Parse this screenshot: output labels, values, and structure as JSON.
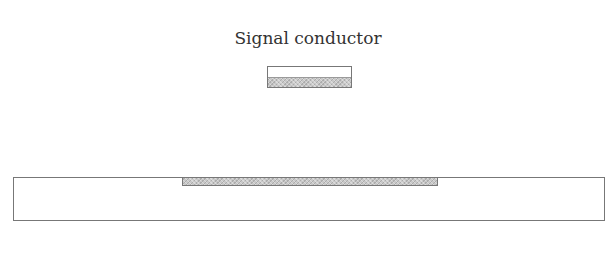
{
  "diagram": {
    "signal_label": "Signal conductor",
    "elements": [
      {
        "name": "signal-conductor",
        "shape": "rectangle",
        "fill": "partial-hatch-bottom"
      },
      {
        "name": "substrate",
        "shape": "rectangle",
        "fill": "none"
      },
      {
        "name": "ground-strip",
        "shape": "rectangle",
        "fill": "hatch"
      }
    ],
    "colors": {
      "stroke": "#777777",
      "hatch": "#c8c8c8",
      "background": "#ffffff"
    }
  }
}
